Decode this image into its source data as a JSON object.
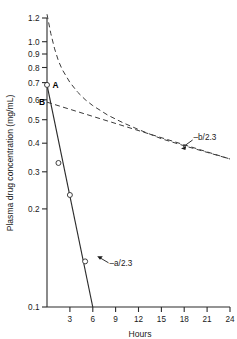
{
  "chart_data": {
    "type": "line",
    "title": "",
    "xlabel": "Hours",
    "ylabel": "Plasma drug concentration (mg/mL)",
    "y_scale": "log",
    "x_scale": "linear",
    "xlim": [
      0,
      24
    ],
    "ylim": [
      0.1,
      1.2
    ],
    "grid": false,
    "legend": "none",
    "x_ticks": [
      3,
      6,
      9,
      12,
      15,
      18,
      21,
      24
    ],
    "x_tick_labels": [
      "3",
      "6",
      "9",
      "12",
      "15",
      "18",
      "21",
      "24"
    ],
    "y_ticks": [
      0.1,
      0.2,
      0.3,
      0.4,
      0.5,
      0.6,
      0.7,
      0.8,
      0.9,
      1.0,
      1.2
    ],
    "y_tick_labels": [
      "0.1",
      "0.2",
      "0.3",
      "0.4",
      "0.5",
      "0.6",
      "0.7",
      "0.8",
      "0.9",
      "1.0",
      "1.2"
    ],
    "series": [
      {
        "name": "observed-plasma-curve",
        "style": "dashed",
        "points": [
          {
            "x": 0.0,
            "y": 1.24
          },
          {
            "x": 0.5,
            "y": 1.05
          },
          {
            "x": 1.0,
            "y": 0.92
          },
          {
            "x": 1.5,
            "y": 0.83
          },
          {
            "x": 2.0,
            "y": 0.77
          },
          {
            "x": 3.0,
            "y": 0.69
          },
          {
            "x": 4.0,
            "y": 0.635
          },
          {
            "x": 5.0,
            "y": 0.595
          },
          {
            "x": 6.0,
            "y": 0.565
          },
          {
            "x": 8.0,
            "y": 0.52
          },
          {
            "x": 10.0,
            "y": 0.487
          },
          {
            "x": 12.0,
            "y": 0.46
          },
          {
            "x": 15.0,
            "y": 0.425
          },
          {
            "x": 18.0,
            "y": 0.4
          },
          {
            "x": 21.0,
            "y": 0.378
          },
          {
            "x": 24.0,
            "y": 0.357
          }
        ]
      },
      {
        "name": "terminal-beta-phase-line",
        "style": "dashed",
        "points": [
          {
            "x": 0.0,
            "y": 0.582
          },
          {
            "x": 24.0,
            "y": 0.357
          }
        ]
      },
      {
        "name": "residual-alpha-phase-line",
        "style": "solid",
        "points": [
          {
            "x": 0.0,
            "y": 0.675
          },
          {
            "x": 6.0,
            "y": 0.1
          }
        ]
      }
    ],
    "data_points": [
      {
        "x": 0.0,
        "y": 0.675,
        "marker": "open-circle"
      },
      {
        "x": 1.5,
        "y": 0.345,
        "marker": "open-circle"
      },
      {
        "x": 3.0,
        "y": 0.262,
        "marker": "open-circle"
      },
      {
        "x": 5.0,
        "y": 0.148,
        "marker": "open-circle"
      }
    ],
    "point_labels": [
      {
        "text": "A",
        "x": 0.0,
        "y": 0.675
      },
      {
        "text": "B",
        "x": 0.0,
        "y": 0.582
      }
    ],
    "annotations": [
      {
        "text": "–b/2.3",
        "x": 18.5,
        "y": 0.42,
        "target_x": 16.8,
        "target_y": 0.405
      },
      {
        "text": "–a/2.3",
        "x": 9.6,
        "y": 0.138,
        "target_x": 7.6,
        "target_y": 0.152
      }
    ]
  },
  "axis": {
    "y_title": "Plasma drug concentration (mg/mL)",
    "x_title": "Hours"
  }
}
